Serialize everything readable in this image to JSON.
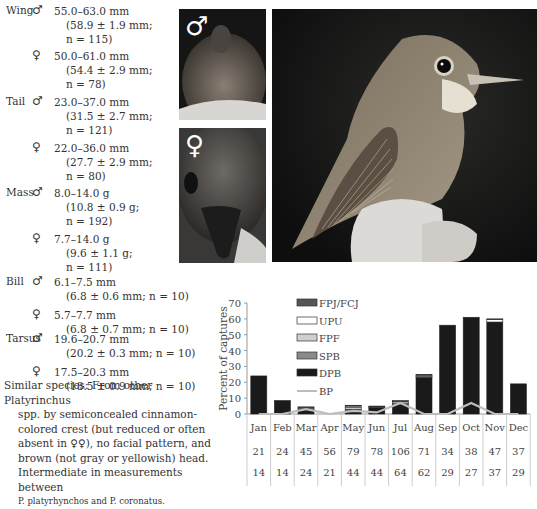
{
  "measurements": [
    {
      "label": "Wing",
      "male": {
        "range": "55.0–63.0 mm",
        "stats1": "(58.9 ± 1.9 mm;",
        "stats2": "n = 115)"
      },
      "female": {
        "range": "50.0–61.0 mm",
        "stats1": "(54.4 ± 2.9 mm;",
        "stats2": "n = 78)"
      }
    },
    {
      "label": "Tail",
      "male": {
        "range": "23.0–37.0 mm",
        "stats1": "(31.5 ± 2.7 mm;",
        "stats2": "n = 121)"
      },
      "female": {
        "range": "22.0–36.0 mm",
        "stats1": "(27.7 ± 2.9 mm;",
        "stats2": "n = 80)"
      }
    },
    {
      "label": "Mass",
      "male": {
        "range": "8.0–14.0 g",
        "stats1": "(10.8 ± 0.9 g;",
        "stats2": "n = 192)"
      },
      "female": {
        "range": "7.7–14.0 g",
        "stats1": "(9.6 ± 1.1 g;",
        "stats2": "n = 111)"
      }
    },
    {
      "label": "Bill",
      "male": {
        "range": "6.1–7.5 mm",
        "stats1": "(6.8 ± 0.6 mm; n = 10)"
      },
      "female": {
        "range": "5.7–7.7 mm",
        "stats1": "(6.8 ± 0.7 mm; n = 10)"
      }
    },
    {
      "label": "Tarsus",
      "male": {
        "range": "19.6–20.7 mm",
        "stats1": "(20.2 ± 0.3 mm; n = 10)"
      },
      "female": {
        "range": "17.5–20.3 mm",
        "stats1": "(18.5 ± 0.9 mm; n = 10)"
      }
    }
  ],
  "symbols": {
    "male": "♂",
    "female": "♀"
  },
  "similar_species": {
    "line1": "Similar species: From other Platyrinchus",
    "line2": "spp. by semiconcealed cinnamon-",
    "line3": "colored crest (but reduced or often",
    "line4": "absent in ♀♀), no facial pattern, and",
    "line5": "brown (not gray or yellowish) head.",
    "line6": "Intermediate in measurements between",
    "line7": "P. platyrhynchos and P. coronatus."
  },
  "photos": {
    "male_label": "♂",
    "female_label": "♀"
  },
  "chart_data": {
    "type": "bar",
    "stacked": true,
    "ylabel": "Percent of captures",
    "ylim": [
      0,
      70
    ],
    "yticks": [
      0,
      10,
      20,
      30,
      40,
      50,
      60,
      70
    ],
    "categories": [
      "Jan",
      "Feb",
      "Mar",
      "Apr",
      "May",
      "Jun",
      "Jul",
      "Aug",
      "Sep",
      "Oct",
      "Nov",
      "Dec"
    ],
    "series": [
      {
        "name": "DPB",
        "color": "#1a1a1a",
        "values": [
          24,
          8.5,
          3,
          0,
          2,
          4,
          6,
          23,
          56,
          61,
          58,
          19
        ]
      },
      {
        "name": "SPB",
        "color": "#8a8a8a",
        "values": [
          0,
          0,
          0.5,
          0,
          1,
          0.5,
          1,
          0.5,
          0,
          0,
          0,
          0
        ]
      },
      {
        "name": "FPF",
        "color": "#cfcfcf",
        "values": [
          0,
          0,
          0,
          0,
          1,
          0,
          0,
          1,
          0,
          0,
          0,
          0
        ]
      },
      {
        "name": "UPU",
        "color": "#ffffff",
        "values": [
          0,
          0,
          0.5,
          0,
          1,
          0,
          1,
          0,
          0,
          0,
          1.5,
          0
        ]
      },
      {
        "name": "FPJ/FCJ",
        "color": "#555555",
        "values": [
          0,
          0,
          0.5,
          0,
          0.5,
          0.5,
          0.5,
          0.5,
          0,
          0,
          0.5,
          0
        ]
      },
      {
        "name": "BP",
        "type": "line",
        "color": "#bdbdbd",
        "values": [
          0,
          0,
          3,
          0,
          2,
          1,
          7,
          0,
          0,
          7,
          0,
          0
        ]
      }
    ],
    "legend": [
      "FPJ/FCJ",
      "UPU",
      "FPF",
      "SPB",
      "DPB",
      "BP"
    ],
    "table_row1": [
      21,
      24,
      45,
      56,
      79,
      78,
      106,
      71,
      34,
      38,
      47,
      37
    ],
    "table_row2": [
      14,
      14,
      24,
      21,
      44,
      44,
      64,
      62,
      29,
      27,
      37,
      29
    ]
  }
}
